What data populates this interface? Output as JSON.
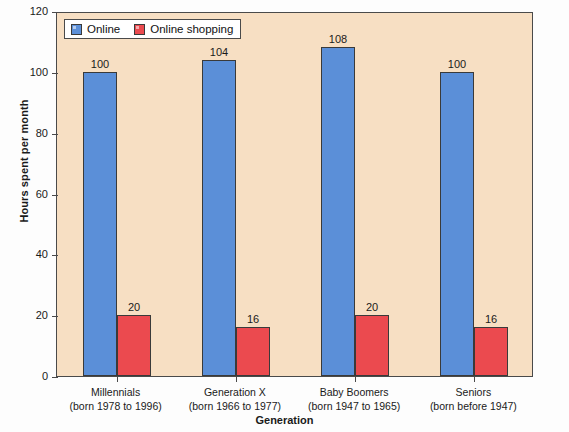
{
  "chart_data": {
    "type": "bar",
    "title": "",
    "xlabel": "Generation",
    "ylabel": "Hours spent per month",
    "ylim": [
      0,
      120
    ],
    "yticks": [
      0,
      20,
      40,
      60,
      80,
      100,
      120
    ],
    "grid": false,
    "legend_position": "top-left",
    "categories": [
      "Millennials",
      "Generation X",
      "Baby Boomers",
      "Seniors"
    ],
    "category_sublabels": [
      "(born 1978 to 1996)",
      "(born 1966 to 1977)",
      "(born 1947 to 1965)",
      "(born before 1947)"
    ],
    "series": [
      {
        "name": "Online",
        "color": "#5b8fd8",
        "values": [
          100,
          104,
          108,
          100
        ]
      },
      {
        "name": "Online shopping",
        "color": "#eb4a4f",
        "values": [
          20,
          16,
          20,
          16
        ]
      }
    ]
  },
  "style": {
    "plot_background": "#f7dfc3",
    "figure_background": "#fdfdfd",
    "axis_color": "#4a4a4a",
    "text_color": "#1a1a1a"
  }
}
